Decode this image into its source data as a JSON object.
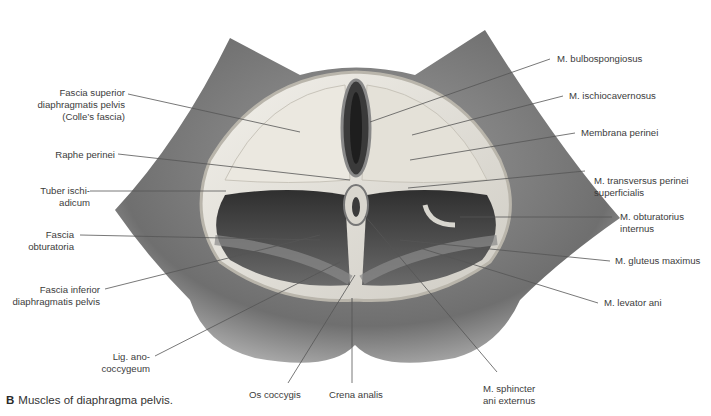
{
  "figure": {
    "caption_letter": "B",
    "caption_text": "Muscles of diaphragma pelvis.",
    "colors": {
      "background": "#ffffff",
      "skin": "#7d7d7d",
      "fascia": "#e8e6df",
      "muscle_dark": "#4a4a4a",
      "leader_line": "#555555",
      "text": "#3c3c3c"
    }
  },
  "labels_left": [
    {
      "id": "fascia-superior",
      "lines": [
        "Fascia superior",
        "diaphragmatis pelvis",
        "(Colle’s fascia)"
      ]
    },
    {
      "id": "raphe-perinei",
      "lines": [
        "Raphe perinei"
      ]
    },
    {
      "id": "tuber-ischiadicum",
      "lines": [
        "Tuber ischi-",
        "adicum"
      ]
    },
    {
      "id": "fascia-obturatoria",
      "lines": [
        "Fascia",
        "obturatoria"
      ]
    },
    {
      "id": "fascia-inferior",
      "lines": [
        "Fascia inferior",
        "diaphragmatis pelvis"
      ]
    },
    {
      "id": "lig-anococcygeum",
      "lines": [
        "Lig. ano-",
        "coccygeum"
      ]
    }
  ],
  "labels_right": [
    {
      "id": "m-bulbospongiosus",
      "lines": [
        "M. bulbospongiosus"
      ]
    },
    {
      "id": "m-ischiocavernosus",
      "lines": [
        "M. ischiocavernosus"
      ]
    },
    {
      "id": "membrana-perinei",
      "lines": [
        "Membrana perinei"
      ]
    },
    {
      "id": "m-transversus",
      "lines": [
        "M. transversus perinei",
        "superficialis"
      ]
    },
    {
      "id": "m-obturatorius",
      "lines": [
        "M. obturatorius",
        "internus"
      ]
    },
    {
      "id": "m-gluteus",
      "lines": [
        "M. gluteus maximus"
      ]
    },
    {
      "id": "m-levator",
      "lines": [
        "M. levator ani"
      ]
    }
  ],
  "labels_bottom": [
    {
      "id": "os-coccygis",
      "lines": [
        "Os coccygis"
      ]
    },
    {
      "id": "crena-analis",
      "lines": [
        "Crena analis"
      ]
    },
    {
      "id": "m-sphincter",
      "lines": [
        "M. sphincter",
        "ani externus"
      ]
    }
  ]
}
